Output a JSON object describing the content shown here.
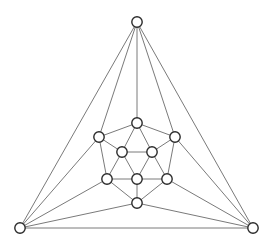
{
  "figure": {
    "width": 274,
    "height": 250,
    "background_color": "#ffffff",
    "edge_color": "#7a7a7a",
    "node_fill_color": "#ffffff",
    "node_stroke_color": "#2b2b2b",
    "node_radius": 5.2,
    "edge_width": 1
  },
  "chart_data": {
    "type": "diagram",
    "subtype": "node-link-graph",
    "xlabel": "",
    "ylabel": "",
    "grid": false,
    "legend": "none",
    "node_count": 12,
    "edge_count": 30,
    "nodes": [
      {
        "id": "apex",
        "label": "",
        "x": 137,
        "y": 22,
        "role": "outer-vertex"
      },
      {
        "id": "bottomleft",
        "label": "",
        "x": 20,
        "y": 228,
        "role": "outer-vertex"
      },
      {
        "id": "bottomright",
        "label": "",
        "x": 253,
        "y": 228,
        "role": "outer-vertex"
      },
      {
        "id": "t",
        "label": "",
        "x": 137,
        "y": 123,
        "role": "inner-top"
      },
      {
        "id": "ul",
        "label": "",
        "x": 99,
        "y": 137,
        "role": "inner-upper-left"
      },
      {
        "id": "ur",
        "label": "",
        "x": 175,
        "y": 137,
        "role": "inner-upper-right"
      },
      {
        "id": "ml",
        "label": "",
        "x": 122,
        "y": 152,
        "role": "inner-middle-left"
      },
      {
        "id": "mr",
        "label": "",
        "x": 152,
        "y": 152,
        "role": "inner-middle-right"
      },
      {
        "id": "ll",
        "label": "",
        "x": 107,
        "y": 179,
        "role": "inner-lower-left"
      },
      {
        "id": "lc",
        "label": "",
        "x": 137,
        "y": 179,
        "role": "inner-lower-center"
      },
      {
        "id": "lr",
        "label": "",
        "x": 167,
        "y": 179,
        "role": "inner-lower-right"
      },
      {
        "id": "b",
        "label": "",
        "x": 137,
        "y": 203,
        "role": "inner-bottom"
      }
    ],
    "edges": [
      {
        "source": "apex",
        "target": "bottomleft"
      },
      {
        "source": "apex",
        "target": "bottomright"
      },
      {
        "source": "bottomleft",
        "target": "bottomright"
      },
      {
        "source": "apex",
        "target": "t"
      },
      {
        "source": "apex",
        "target": "ul"
      },
      {
        "source": "apex",
        "target": "ur"
      },
      {
        "source": "bottomleft",
        "target": "ul"
      },
      {
        "source": "bottomleft",
        "target": "ll"
      },
      {
        "source": "bottomleft",
        "target": "b"
      },
      {
        "source": "bottomright",
        "target": "ur"
      },
      {
        "source": "bottomright",
        "target": "lr"
      },
      {
        "source": "bottomright",
        "target": "b"
      },
      {
        "source": "t",
        "target": "ul"
      },
      {
        "source": "t",
        "target": "ur"
      },
      {
        "source": "t",
        "target": "ml"
      },
      {
        "source": "t",
        "target": "mr"
      },
      {
        "source": "ul",
        "target": "ml"
      },
      {
        "source": "ul",
        "target": "ll"
      },
      {
        "source": "ur",
        "target": "mr"
      },
      {
        "source": "ur",
        "target": "lr"
      },
      {
        "source": "ml",
        "target": "mr"
      },
      {
        "source": "ml",
        "target": "ll"
      },
      {
        "source": "ml",
        "target": "lc"
      },
      {
        "source": "mr",
        "target": "lc"
      },
      {
        "source": "mr",
        "target": "lr"
      },
      {
        "source": "ll",
        "target": "lc"
      },
      {
        "source": "lc",
        "target": "lr"
      },
      {
        "source": "ll",
        "target": "b"
      },
      {
        "source": "lc",
        "target": "b"
      },
      {
        "source": "lr",
        "target": "b"
      }
    ]
  }
}
